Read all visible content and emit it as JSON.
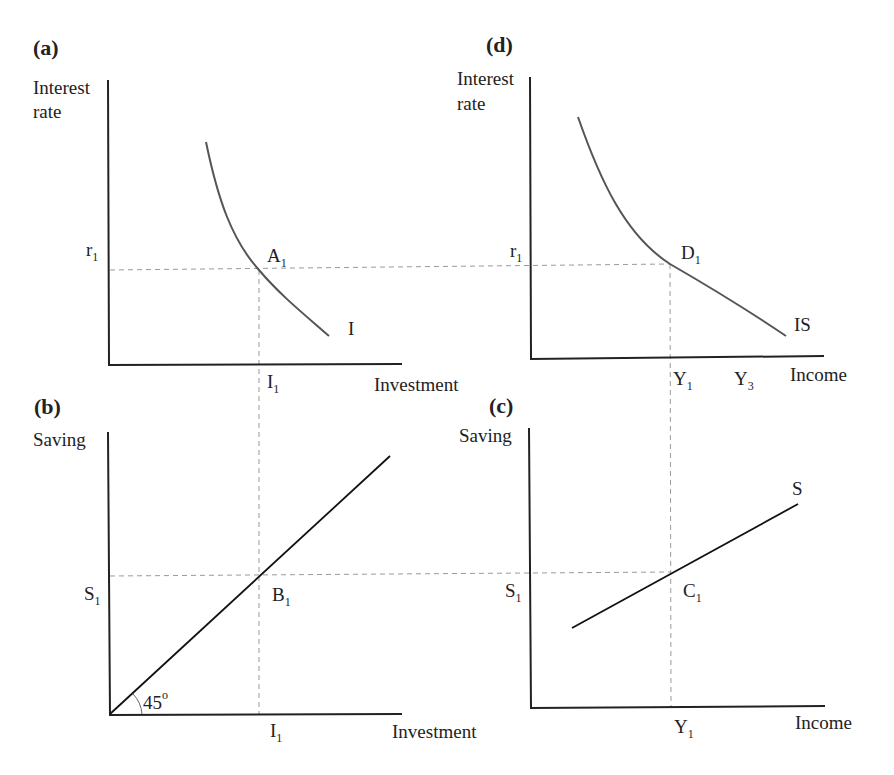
{
  "figure": {
    "panels": [
      {
        "id": "a",
        "label": "(a)",
        "y_axis": [
          "Interest",
          "rate"
        ],
        "x_axis": "Investment",
        "curve_label": "I",
        "point": "A",
        "point_sub": "1",
        "y_tick": "r",
        "y_tick_sub": "1",
        "x_tick": "I",
        "x_tick_sub": "1"
      },
      {
        "id": "b",
        "label": "(b)",
        "y_axis": [
          "Saving"
        ],
        "x_axis": "Investment",
        "point": "B",
        "point_sub": "1",
        "y_tick": "S",
        "y_tick_sub": "1",
        "x_tick": "I",
        "x_tick_sub": "1",
        "angle": "45",
        "angle_unit": "o"
      },
      {
        "id": "c",
        "label": "(c)",
        "y_axis": [
          "Saving"
        ],
        "x_axis": "Income",
        "curve_label": "S",
        "point": "C",
        "point_sub": "1",
        "y_tick": "S",
        "y_tick_sub": "1",
        "x_tick": "Y",
        "x_tick_sub": "1"
      },
      {
        "id": "d",
        "label": "(d)",
        "y_axis": [
          "Interest",
          "rate"
        ],
        "x_axis": "Income",
        "curve_label": "IS",
        "point": "D",
        "point_sub": "1",
        "y_tick": "r",
        "y_tick_sub": "1",
        "x_tick": "Y",
        "x_tick_sub": "1",
        "x_tick2": "Y",
        "x_tick2_sub": "3"
      }
    ]
  },
  "colors": {
    "axis": "#222222",
    "curve": "#555555",
    "line": "#111111",
    "dashed": "#999999"
  }
}
